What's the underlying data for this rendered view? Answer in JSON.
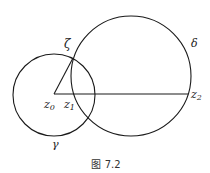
{
  "figure": {
    "caption": "图 7.2",
    "colors": {
      "stroke": "#1a1a1a",
      "text": "#222222",
      "background": "#ffffff"
    }
  },
  "circles": [
    {
      "name": "gamma",
      "label": "γ",
      "cx": 54,
      "cy": 95,
      "r": 41
    },
    {
      "name": "delta",
      "label": "δ",
      "cx": 131,
      "cy": 76,
      "r": 60
    }
  ],
  "points": {
    "z0": {
      "label": "z",
      "sub": "0",
      "x": 54,
      "y": 94
    },
    "z1": {
      "label": "z",
      "sub": "1",
      "x": 73,
      "y": 94
    },
    "z2": {
      "label": "z",
      "sub": "2",
      "x": 188,
      "y": 94
    },
    "zeta": {
      "label": "ζ",
      "x": 73,
      "y": 58
    }
  },
  "segments": [
    {
      "from": "z0",
      "to": "z2"
    },
    {
      "from": "z0",
      "to": "zeta"
    }
  ]
}
